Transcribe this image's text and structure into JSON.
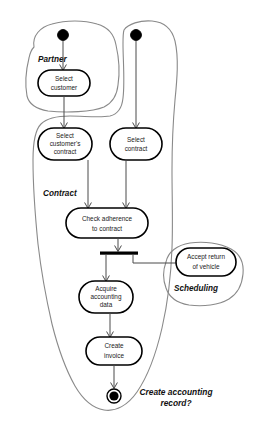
{
  "diagram": {
    "type": "uml-activity-diagram",
    "title": "",
    "canvas": {
      "width": 254,
      "height": 431
    },
    "colors": {
      "node_stroke": "#000000",
      "node_fill": "#ffffff",
      "region_stroke": "#8a8a8a",
      "flow_stroke": "#4a4a4a",
      "text": "#1a1a1a"
    },
    "regions": [
      {
        "id": "partner",
        "label": "Partner"
      },
      {
        "id": "contract",
        "label": "Contract"
      },
      {
        "id": "scheduling",
        "label": "Scheduling"
      }
    ],
    "start_nodes": [
      {
        "id": "start-partner",
        "name": "start-node-partner"
      },
      {
        "id": "start-contract",
        "name": "start-node-contract"
      }
    ],
    "actions": [
      {
        "id": "select-customer",
        "lines": [
          "Select",
          "customer"
        ]
      },
      {
        "id": "select-customers-contract",
        "lines": [
          "Select",
          "customer's",
          "contract"
        ]
      },
      {
        "id": "select-contract",
        "lines": [
          "Select",
          "contract"
        ]
      },
      {
        "id": "check-adherence",
        "lines": [
          "Check adherence",
          "to contract"
        ]
      },
      {
        "id": "accept-return-vehicle",
        "lines": [
          "Accept return",
          "of vehicle"
        ]
      },
      {
        "id": "acquire-accounting-data",
        "lines": [
          "Acquire",
          "accounting",
          "data"
        ]
      },
      {
        "id": "create-invoice",
        "lines": [
          "Create",
          "invoice"
        ]
      }
    ],
    "fork": {
      "id": "fork-bar",
      "label": ""
    },
    "end_node": {
      "id": "end-node",
      "lines": [
        "Create accounting",
        "record?"
      ]
    },
    "labels": {
      "select_customer_l1": "Select",
      "select_customer_l2": "customer",
      "select_customers_contract_l1": "Select",
      "select_customers_contract_l2": "customer's",
      "select_customers_contract_l3": "contract",
      "select_contract_l1": "Select",
      "select_contract_l2": "contract",
      "check_adherence_l1": "Check adherence",
      "check_adherence_l2": "to contract",
      "accept_return_l1": "Accept return",
      "accept_return_l2": "of vehicle",
      "acquire_l1": "Acquire",
      "acquire_l2": "accounting",
      "acquire_l3": "data",
      "create_invoice_l1": "Create",
      "create_invoice_l2": "invoice",
      "end_l1": "Create accounting",
      "end_l2": "record?",
      "region_partner": "Partner",
      "region_contract": "Contract",
      "region_scheduling": "Scheduling"
    }
  }
}
